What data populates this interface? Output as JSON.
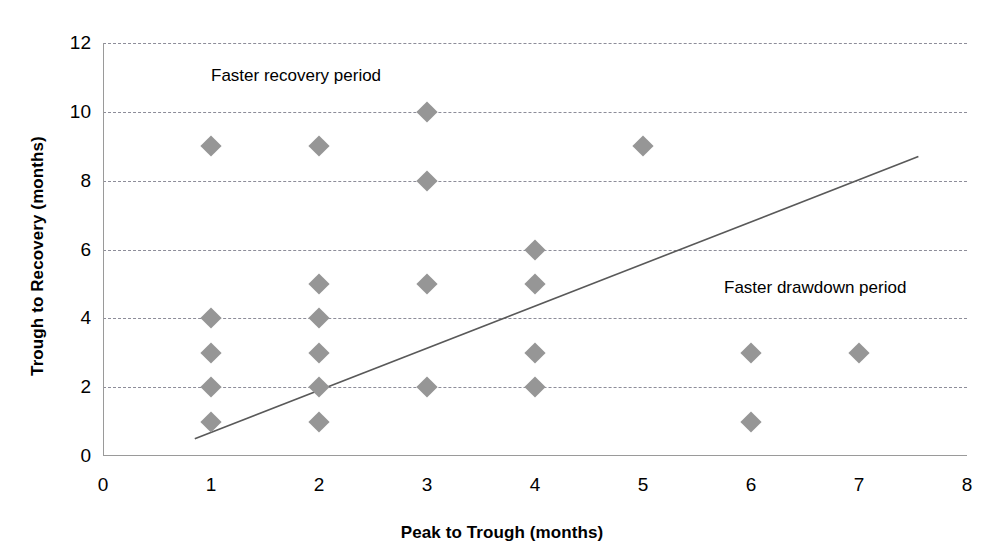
{
  "chart_data": {
    "type": "scatter",
    "title": "",
    "xlabel": "Peak to Trough (months)",
    "ylabel": "Trough to Recovery (months)",
    "xlim": [
      0,
      8
    ],
    "ylim": [
      0,
      12
    ],
    "xticks": [
      "0",
      "1",
      "2",
      "3",
      "4",
      "5",
      "6",
      "7",
      "8"
    ],
    "yticks": [
      "0",
      "2",
      "4",
      "6",
      "8",
      "10",
      "12"
    ],
    "grid": "horizontal-dashed",
    "legend": "none",
    "marker_shape": "diamond",
    "marker_color": "#969696",
    "trendline_color": "#595959",
    "points": [
      {
        "x": 1,
        "y": 9
      },
      {
        "x": 1,
        "y": 4
      },
      {
        "x": 1,
        "y": 3
      },
      {
        "x": 1,
        "y": 2
      },
      {
        "x": 1,
        "y": 1
      },
      {
        "x": 2,
        "y": 9
      },
      {
        "x": 2,
        "y": 5
      },
      {
        "x": 2,
        "y": 4
      },
      {
        "x": 2,
        "y": 3
      },
      {
        "x": 2,
        "y": 2
      },
      {
        "x": 2,
        "y": 1
      },
      {
        "x": 3,
        "y": 10
      },
      {
        "x": 3,
        "y": 8
      },
      {
        "x": 3,
        "y": 5
      },
      {
        "x": 3,
        "y": 2
      },
      {
        "x": 4,
        "y": 6
      },
      {
        "x": 4,
        "y": 5
      },
      {
        "x": 4,
        "y": 3
      },
      {
        "x": 4,
        "y": 2
      },
      {
        "x": 5,
        "y": 9
      },
      {
        "x": 6,
        "y": 3
      },
      {
        "x": 6,
        "y": 1
      },
      {
        "x": 7,
        "y": 3
      }
    ],
    "trendline": {
      "x1": 0.85,
      "y1": 0.5,
      "x2": 7.55,
      "y2": 8.7
    },
    "annotations": [
      {
        "text": "Faster recovery period",
        "x": 1.0,
        "y": 11.0,
        "align": "left"
      },
      {
        "text": "Faster drawdown period",
        "x": 5.75,
        "y": 4.85,
        "align": "left"
      }
    ]
  },
  "labels": {
    "annotation_faster_recovery": "Faster recovery period",
    "annotation_faster_drawdown": "Faster drawdown period"
  }
}
